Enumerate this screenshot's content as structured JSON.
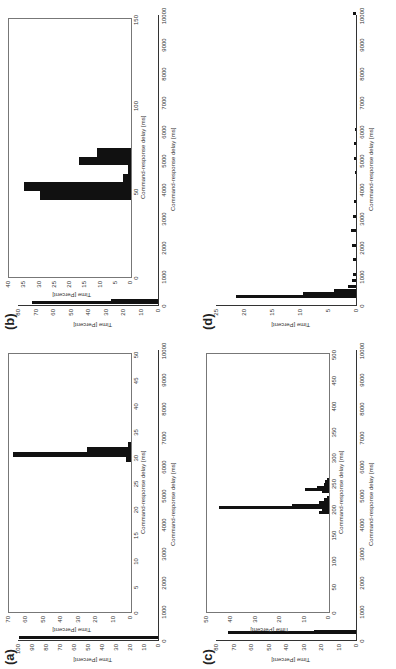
{
  "figure": {
    "panels": [
      "(a)",
      "(b)",
      "(c)",
      "(d)"
    ],
    "outer_xlabel": "Command-response delay [ms]",
    "inset_xlabel": "Command-response delay [ms]",
    "ylabel": "Time [Percent]",
    "rotation": "90deg counter-clockwise"
  },
  "chart_data": [
    {
      "panel": "(a)",
      "type": "bar",
      "title": "",
      "xlabel": "Command-response delay [ms]",
      "ylabel": "Time [Percent]",
      "xlim": [
        0,
        10000
      ],
      "ylim": [
        0,
        100
      ],
      "xticks": [
        0,
        1000,
        2000,
        3000,
        4000,
        5000,
        6000,
        7000,
        8000,
        9000,
        10000
      ],
      "yticks": [
        0,
        10,
        20,
        30,
        40,
        50,
        60,
        70,
        80,
        90,
        100
      ],
      "bars": [
        {
          "x": 30,
          "value": 99
        }
      ],
      "inset": {
        "xlim": [
          0,
          50
        ],
        "ylim": [
          0,
          70
        ],
        "xticks": [
          0,
          5,
          10,
          15,
          20,
          25,
          30,
          35,
          40,
          45,
          50
        ],
        "yticks": [
          0,
          10,
          20,
          30,
          40,
          50,
          60,
          70
        ],
        "bins": [
          29,
          30,
          31,
          32
        ],
        "values": [
          3,
          68,
          25,
          2
        ]
      }
    },
    {
      "panel": "(b)",
      "type": "bar",
      "xlabel": "Command-response delay [ms]",
      "ylabel": "Time [Percent]",
      "xlim": [
        0,
        10000
      ],
      "ylim": [
        0,
        80
      ],
      "xticks": [
        0,
        1000,
        2000,
        3000,
        4000,
        5000,
        6000,
        7000,
        8000,
        9000,
        10000
      ],
      "yticks": [
        0,
        10,
        20,
        30,
        40,
        50,
        60,
        70,
        80
      ],
      "bars": [
        {
          "x": 50,
          "value": 72
        },
        {
          "x": 100,
          "value": 27
        }
      ],
      "inset": {
        "xlim": [
          0,
          150
        ],
        "ylim": [
          0,
          40
        ],
        "xticks": [
          0,
          50,
          100,
          150
        ],
        "yticks": [
          0,
          5,
          10,
          15,
          20,
          25,
          30,
          35,
          40
        ],
        "bins": [
          45,
          50,
          55,
          60,
          65,
          70
        ],
        "values": [
          30,
          35,
          2.5,
          1,
          17,
          11
        ]
      }
    },
    {
      "panel": "(c)",
      "type": "bar",
      "xlabel": "Command-response delay [ms]",
      "ylabel": "Time [Percent]",
      "xlim": [
        0,
        10000
      ],
      "ylim": [
        0,
        80
      ],
      "xticks": [
        0,
        1000,
        2000,
        3000,
        4000,
        5000,
        6000,
        7000,
        8000,
        9000,
        10000
      ],
      "yticks": [
        0,
        10,
        20,
        30,
        40,
        50,
        60,
        70,
        80
      ],
      "bars": [
        {
          "x": 200,
          "value": 73
        },
        {
          "x": 250,
          "value": 24
        }
      ],
      "inset": {
        "xlim": [
          0,
          500
        ],
        "ylim": [
          0,
          50
        ],
        "xticks": [
          0,
          50,
          100,
          150,
          200,
          250,
          300,
          350,
          400,
          450,
          500
        ],
        "yticks": [
          0,
          10,
          20,
          30,
          40,
          50
        ],
        "bins": [
          190,
          195,
          200,
          205,
          210,
          215,
          220,
          230,
          235,
          240,
          245,
          250,
          255
        ],
        "values": [
          4,
          3,
          45,
          15,
          4,
          2,
          1,
          3,
          10,
          5,
          2,
          1.5,
          1
        ]
      }
    },
    {
      "panel": "(d)",
      "type": "bar",
      "xlabel": "Command-response delay [ms]",
      "ylabel": "Time [Percent]",
      "xlim": [
        0,
        10000
      ],
      "ylim": [
        0,
        25
      ],
      "xticks": [
        0,
        1000,
        2000,
        3000,
        4000,
        5000,
        6000,
        7000,
        8000,
        9000,
        10000
      ],
      "yticks": [
        0,
        5,
        10,
        15,
        20,
        25
      ],
      "bins": [
        250,
        350,
        450,
        600,
        800,
        1000,
        1500,
        2000,
        2500,
        3000,
        3500,
        4500,
        5000,
        5500,
        6000,
        10000
      ],
      "values": [
        21.5,
        9.5,
        4,
        1.5,
        0.8,
        0.6,
        0.5,
        0.8,
        0.9,
        0.5,
        0.3,
        0.2,
        0.4,
        0.3,
        0.2,
        0.6
      ]
    }
  ]
}
